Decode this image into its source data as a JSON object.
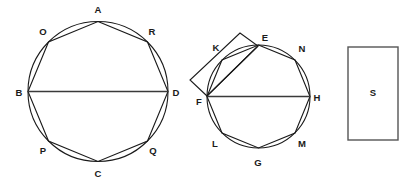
{
  "figure": {
    "background_color": "#ffffff",
    "stroke_color": "#1a1a1a",
    "diameter_color": "#3a3a3a",
    "rect_color": "#555555",
    "width": 416,
    "height": 187
  },
  "shapes": {
    "left_circle": {
      "name": "left-circle",
      "cx": 98,
      "cy": 91.5,
      "r": 70
    },
    "right_circle": {
      "name": "middle-circle",
      "cx": 258.5,
      "cy": 96.5,
      "r": 51.5
    },
    "square_s": {
      "name": "square-s",
      "x": 348,
      "y": 47,
      "width": 50,
      "height": 93
    },
    "attached_square": {
      "name": "attached-square",
      "points": "207,96 190,80 240,33 258,46"
    }
  },
  "left_figure": {
    "name": "left-octagon-figure",
    "polygon_points": "98,21.5 147.5,42 168,91.5 147.5,141 98,161.5 48.5,141 28,91.5 48.5,42",
    "diameter": {
      "x1": 28,
      "y1": 91.5,
      "x2": 168,
      "y2": 91.5
    },
    "vertices": [
      {
        "label": "A",
        "vx": 98,
        "vy": 21.5,
        "lx": 98,
        "ly": 10
      },
      {
        "label": "R",
        "vx": 147.5,
        "vy": 42,
        "lx": 152,
        "ly": 32
      },
      {
        "label": "D",
        "vx": 168,
        "vy": 91.5,
        "lx": 176,
        "ly": 93
      },
      {
        "label": "Q",
        "vx": 147.5,
        "vy": 141,
        "lx": 153,
        "ly": 151
      },
      {
        "label": "C",
        "vx": 98,
        "vy": 161.5,
        "lx": 98,
        "ly": 174
      },
      {
        "label": "P",
        "vx": 48.5,
        "vy": 141,
        "lx": 43,
        "ly": 151
      },
      {
        "label": "B",
        "vx": 28,
        "vy": 91.5,
        "lx": 19,
        "ly": 93
      },
      {
        "label": "O",
        "vx": 48.5,
        "vy": 42,
        "lx": 43,
        "ly": 32
      }
    ]
  },
  "middle_figure": {
    "name": "middle-octagon-figure",
    "polygon_points": "258.5,45 295,60 310,96.5 295,133 258.5,148 222,133 207,96.5 222,60",
    "diameter": {
      "x1": 207,
      "y1": 96.5,
      "x2": 310,
      "y2": 96.5
    },
    "square_edges": [
      {
        "x1": 207,
        "y1": 96,
        "x2": 190,
        "y2": 80
      },
      {
        "x1": 190,
        "y1": 80,
        "x2": 240,
        "y2": 33
      },
      {
        "x1": 240,
        "y1": 33,
        "x2": 258,
        "y2": 46
      },
      {
        "x1": 258,
        "y1": 46,
        "x2": 207,
        "y2": 96
      }
    ],
    "vertices": [
      {
        "label": "E",
        "vx": 258.5,
        "vy": 45,
        "lx": 265,
        "ly": 38
      },
      {
        "label": "N",
        "vx": 295,
        "vy": 60,
        "lx": 302,
        "ly": 49
      },
      {
        "label": "H",
        "vx": 310,
        "vy": 96.5,
        "lx": 317,
        "ly": 98
      },
      {
        "label": "M",
        "vx": 295,
        "vy": 133,
        "lx": 302,
        "ly": 144
      },
      {
        "label": "G",
        "vx": 258.5,
        "vy": 148,
        "lx": 258,
        "ly": 163
      },
      {
        "label": "L",
        "vx": 222,
        "vy": 133,
        "lx": 215,
        "ly": 144
      },
      {
        "label": "F",
        "vx": 207,
        "vy": 96.5,
        "lx": 199,
        "ly": 102
      },
      {
        "label": "K",
        "vx": 222,
        "vy": 60,
        "lx": 216,
        "ly": 48
      }
    ]
  },
  "right_figure": {
    "name": "rectangle-s-figure",
    "label": "S",
    "label_x": 373,
    "label_y": 93
  }
}
